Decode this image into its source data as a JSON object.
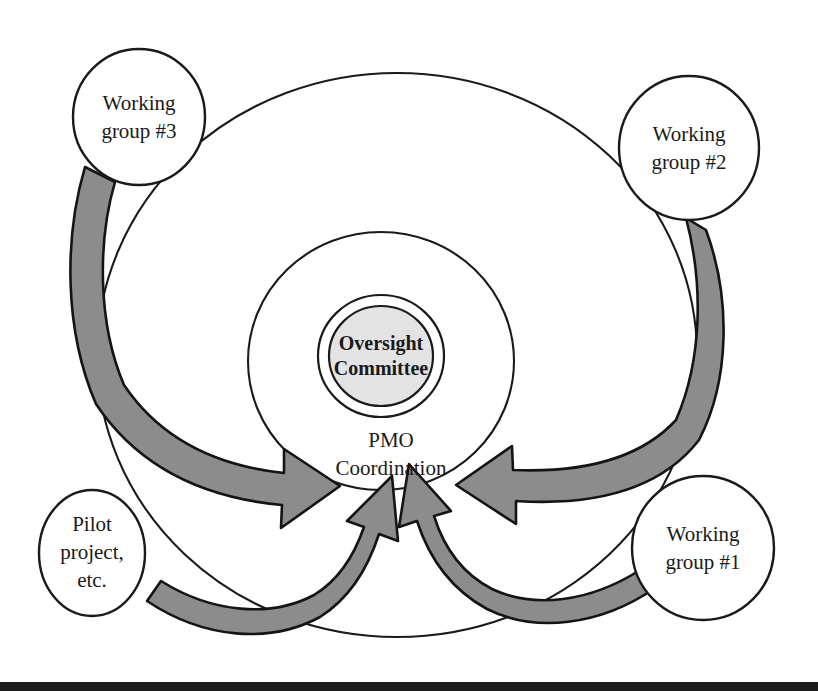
{
  "diagram": {
    "background_color": "#ffffff",
    "line_color": "#1a1a1a",
    "arrow_fill_color": "#8c8c8c",
    "core_fill_color": "#e3e3e3",
    "bottom_bar_color": "#1c1c1c",
    "center": {
      "core_line1": "Oversight",
      "core_line2": "Committee",
      "ring_line1": "PMO",
      "ring_line2": "Coordination"
    },
    "satellites": [
      {
        "id": "working-group-3",
        "line1": "Working",
        "line2": "group #3",
        "line3": "",
        "cx": 139,
        "cy": 117,
        "rx": 66,
        "ry": 68
      },
      {
        "id": "working-group-2",
        "line1": "Working",
        "line2": "group #2",
        "line3": "",
        "cx": 689,
        "cy": 148,
        "rx": 70,
        "ry": 72
      },
      {
        "id": "working-group-1",
        "line1": "Working",
        "line2": "group #1",
        "line3": "",
        "cx": 703,
        "cy": 548,
        "rx": 71,
        "ry": 72
      },
      {
        "id": "pilot-project",
        "line1": "Pilot",
        "line2": "project,",
        "line3": "etc.",
        "cx": 92,
        "cy": 553,
        "rx": 53,
        "ry": 63
      }
    ],
    "rings": [
      {
        "id": "outer-ring",
        "cx": 397,
        "cy": 355,
        "rx": 300,
        "ry": 282
      },
      {
        "id": "middle-ring",
        "cx": 381,
        "cy": 361,
        "rx": 133,
        "ry": 129
      },
      {
        "id": "core-ring",
        "cx": 381,
        "cy": 356,
        "rx": 63,
        "ry": 61
      },
      {
        "id": "core-disc",
        "cx": 381,
        "cy": 356,
        "rx": 52,
        "ry": 50
      }
    ],
    "arrows": [
      {
        "id": "arrow-from-working-group-3",
        "source": "working-group-3",
        "target": "center"
      },
      {
        "id": "arrow-from-working-group-2",
        "source": "working-group-2",
        "target": "center"
      },
      {
        "id": "arrow-from-working-group-1",
        "source": "working-group-1",
        "target": "center"
      },
      {
        "id": "arrow-from-pilot-project",
        "source": "pilot-project",
        "target": "center"
      }
    ],
    "bottom_bar": {
      "top": 682,
      "height": 9
    }
  }
}
